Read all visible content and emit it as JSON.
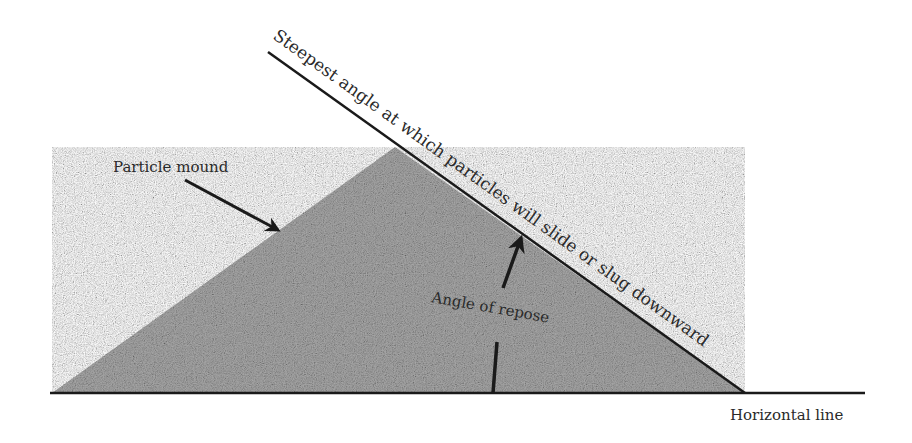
{
  "diagram": {
    "labels": {
      "steepest_angle": "Steepest angle at which particles will slide or slug downward",
      "particle_mound": "Particle mound",
      "angle_of_repose": "Angle of repose",
      "horizontal_line": "Horizontal line"
    },
    "colors": {
      "mound_fill": "#8c8c8c",
      "line": "#1a1a1a",
      "text": "#2a2a2a",
      "background": "#ffffff"
    }
  }
}
